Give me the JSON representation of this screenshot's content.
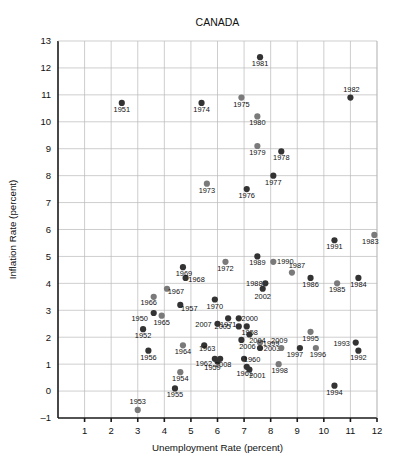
{
  "chart_data": {
    "type": "scatter",
    "title": "CANADA",
    "xlabel": "Unemployment Rate (percent)",
    "ylabel": "Inflation Rate (percent)",
    "xlim": [
      0,
      12
    ],
    "ylim": [
      -1,
      13
    ],
    "xticks": [
      1,
      2,
      3,
      4,
      5,
      6,
      7,
      8,
      9,
      10,
      11,
      12
    ],
    "yticks": [
      -1,
      0,
      1,
      2,
      3,
      4,
      5,
      6,
      7,
      8,
      9,
      10,
      11,
      12,
      13
    ],
    "grid": true,
    "legend": null,
    "marker_colors": {
      "dark": "#333333",
      "light": "#7a7a7a"
    },
    "points": [
      {
        "label": "1950",
        "x": 3.6,
        "y": 2.9,
        "shade": "dark",
        "lx": -14,
        "ly": 8
      },
      {
        "label": "1951",
        "x": 2.4,
        "y": 10.7,
        "shade": "dark",
        "lx": 0,
        "ly": 9
      },
      {
        "label": "1952",
        "x": 3.2,
        "y": 2.3,
        "shade": "dark",
        "lx": 0,
        "ly": 9
      },
      {
        "label": "1953",
        "x": 3.0,
        "y": -0.7,
        "shade": "light",
        "lx": 0,
        "ly": -6
      },
      {
        "label": "1954",
        "x": 4.6,
        "y": 0.7,
        "shade": "light",
        "lx": 0,
        "ly": 9
      },
      {
        "label": "1955",
        "x": 4.4,
        "y": 0.1,
        "shade": "dark",
        "lx": 0,
        "ly": 9
      },
      {
        "label": "1956",
        "x": 3.4,
        "y": 1.5,
        "shade": "dark",
        "lx": 0,
        "ly": 9
      },
      {
        "label": "1957",
        "x": 4.6,
        "y": 3.2,
        "shade": "dark",
        "lx": 9,
        "ly": 6
      },
      {
        "label": "1958",
        "x": 7.1,
        "y": 2.4,
        "shade": "dark",
        "lx": 3,
        "ly": 9
      },
      {
        "label": "1959",
        "x": 6.0,
        "y": 1.1,
        "shade": "dark",
        "lx": -5,
        "ly": 9
      },
      {
        "label": "1960",
        "x": 7.0,
        "y": 1.2,
        "shade": "dark",
        "lx": 8,
        "ly": 3
      },
      {
        "label": "1961",
        "x": 7.1,
        "y": 0.9,
        "shade": "dark",
        "lx": -2,
        "ly": 9
      },
      {
        "label": "1962",
        "x": 5.9,
        "y": 1.2,
        "shade": "dark",
        "lx": -11,
        "ly": 7
      },
      {
        "label": "1963",
        "x": 5.5,
        "y": 1.7,
        "shade": "dark",
        "lx": 3,
        "ly": 6
      },
      {
        "label": "1964",
        "x": 4.7,
        "y": 1.7,
        "shade": "light",
        "lx": 0,
        "ly": 9
      },
      {
        "label": "1965",
        "x": 3.9,
        "y": 2.8,
        "shade": "light",
        "lx": 0,
        "ly": 9
      },
      {
        "label": "1966",
        "x": 3.6,
        "y": 3.5,
        "shade": "light",
        "lx": -5,
        "ly": 8
      },
      {
        "label": "1967",
        "x": 4.1,
        "y": 3.8,
        "shade": "light",
        "lx": 9,
        "ly": 5
      },
      {
        "label": "1968",
        "x": 4.8,
        "y": 4.2,
        "shade": "dark",
        "lx": 11,
        "ly": 4
      },
      {
        "label": "1969",
        "x": 4.7,
        "y": 4.6,
        "shade": "dark",
        "lx": 1,
        "ly": 9
      },
      {
        "label": "1970",
        "x": 5.9,
        "y": 3.4,
        "shade": "dark",
        "lx": 0,
        "ly": 9
      },
      {
        "label": "1971",
        "x": 6.4,
        "y": 2.7,
        "shade": "dark",
        "lx": 0,
        "ly": 9
      },
      {
        "label": "1972",
        "x": 6.3,
        "y": 4.8,
        "shade": "light",
        "lx": 0,
        "ly": 9
      },
      {
        "label": "1973",
        "x": 5.6,
        "y": 7.7,
        "shade": "light",
        "lx": 0,
        "ly": 9
      },
      {
        "label": "1974",
        "x": 5.4,
        "y": 10.7,
        "shade": "dark",
        "lx": 0,
        "ly": 9
      },
      {
        "label": "1975",
        "x": 6.9,
        "y": 10.9,
        "shade": "light",
        "lx": 0,
        "ly": 9
      },
      {
        "label": "1976",
        "x": 7.1,
        "y": 7.5,
        "shade": "dark",
        "lx": 0,
        "ly": 9
      },
      {
        "label": "1977",
        "x": 8.1,
        "y": 8.0,
        "shade": "dark",
        "lx": 0,
        "ly": 9
      },
      {
        "label": "1978",
        "x": 8.4,
        "y": 8.9,
        "shade": "dark",
        "lx": 0,
        "ly": 9
      },
      {
        "label": "1979",
        "x": 7.5,
        "y": 9.1,
        "shade": "light",
        "lx": 0,
        "ly": 9
      },
      {
        "label": "1980",
        "x": 7.5,
        "y": 10.2,
        "shade": "light",
        "lx": 0,
        "ly": 9
      },
      {
        "label": "1981",
        "x": 7.6,
        "y": 12.4,
        "shade": "dark",
        "lx": 0,
        "ly": 9
      },
      {
        "label": "1982",
        "x": 11.0,
        "y": 10.9,
        "shade": "dark",
        "lx": 1,
        "ly": -6
      },
      {
        "label": "1983",
        "x": 11.9,
        "y": 5.8,
        "shade": "light",
        "lx": -4,
        "ly": 9
      },
      {
        "label": "1984",
        "x": 11.3,
        "y": 4.2,
        "shade": "dark",
        "lx": 0,
        "ly": 9
      },
      {
        "label": "1985",
        "x": 10.5,
        "y": 4.0,
        "shade": "light",
        "lx": 0,
        "ly": 9
      },
      {
        "label": "1986",
        "x": 9.5,
        "y": 4.2,
        "shade": "dark",
        "lx": 0,
        "ly": 9
      },
      {
        "label": "1987",
        "x": 8.8,
        "y": 4.4,
        "shade": "light",
        "lx": 5,
        "ly": -5
      },
      {
        "label": "1988",
        "x": 7.8,
        "y": 4.0,
        "shade": "dark",
        "lx": -11,
        "ly": 3
      },
      {
        "label": "1989",
        "x": 7.5,
        "y": 5.0,
        "shade": "dark",
        "lx": 0,
        "ly": 9
      },
      {
        "label": "1990",
        "x": 8.1,
        "y": 4.8,
        "shade": "light",
        "lx": 12,
        "ly": 2
      },
      {
        "label": "1991",
        "x": 10.4,
        "y": 5.6,
        "shade": "dark",
        "lx": 0,
        "ly": 9
      },
      {
        "label": "1992",
        "x": 11.3,
        "y": 1.5,
        "shade": "dark",
        "lx": 0,
        "ly": 9
      },
      {
        "label": "1993",
        "x": 11.2,
        "y": 1.8,
        "shade": "dark",
        "lx": -14,
        "ly": 3
      },
      {
        "label": "1994",
        "x": 10.4,
        "y": 0.2,
        "shade": "dark",
        "lx": 0,
        "ly": 9
      },
      {
        "label": "1995",
        "x": 9.5,
        "y": 2.2,
        "shade": "light",
        "lx": 0,
        "ly": 9
      },
      {
        "label": "1996",
        "x": 9.7,
        "y": 1.6,
        "shade": "light",
        "lx": 2,
        "ly": 9
      },
      {
        "label": "1997",
        "x": 9.1,
        "y": 1.6,
        "shade": "dark",
        "lx": -5,
        "ly": 9
      },
      {
        "label": "1998",
        "x": 8.3,
        "y": 1.0,
        "shade": "light",
        "lx": 1,
        "ly": 9
      },
      {
        "label": "1999",
        "x": 7.6,
        "y": 1.8,
        "shade": "light",
        "lx": 11,
        "ly": 3
      },
      {
        "label": "2000",
        "x": 6.8,
        "y": 2.7,
        "shade": "dark",
        "lx": 11,
        "ly": 3
      },
      {
        "label": "2001",
        "x": 7.2,
        "y": 0.8,
        "shade": "dark",
        "lx": 8,
        "ly": 8
      },
      {
        "label": "2002",
        "x": 7.7,
        "y": 3.8,
        "shade": "dark",
        "lx": 0,
        "ly": 10
      },
      {
        "label": "2003",
        "x": 7.6,
        "y": 1.6,
        "shade": "dark",
        "lx": 12,
        "ly": 3
      },
      {
        "label": "2004",
        "x": 7.2,
        "y": 2.1,
        "shade": "dark",
        "lx": 8,
        "ly": 8
      },
      {
        "label": "2005",
        "x": 6.8,
        "y": 2.4,
        "shade": "dark",
        "lx": -16,
        "ly": 3
      },
      {
        "label": "2006",
        "x": 6.9,
        "y": 1.9,
        "shade": "dark",
        "lx": 6,
        "ly": 9
      },
      {
        "label": "2007",
        "x": 6.0,
        "y": 2.5,
        "shade": "dark",
        "lx": -14,
        "ly": 3
      },
      {
        "label": "2008",
        "x": 6.1,
        "y": 1.2,
        "shade": "dark",
        "lx": 3,
        "ly": 8
      },
      {
        "label": "2009",
        "x": 8.4,
        "y": 1.6,
        "shade": "light",
        "lx": -2,
        "ly": -5
      }
    ]
  }
}
